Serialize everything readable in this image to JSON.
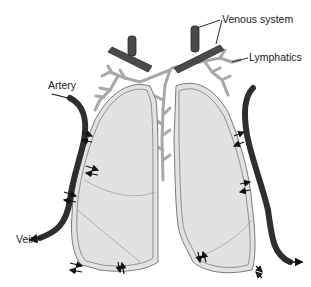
{
  "diagram": {
    "labels": {
      "venous": "Venous system",
      "lymphatics": "Lymphatics",
      "artery": "Artery",
      "vein": "Vein"
    },
    "colors": {
      "vessel": "#4a4a4a",
      "vessel_dark": "#2a2a2a",
      "lymph": "#a8a8a8",
      "lung_fill": "#e2e2e2",
      "pleura_line": "#7a7a7a",
      "arrow": "#111111"
    }
  }
}
